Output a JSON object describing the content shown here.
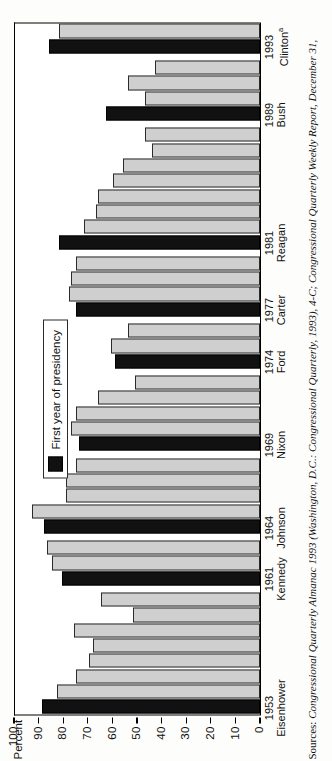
{
  "chart_data": {
    "type": "bar",
    "title": "",
    "xlabel": "",
    "ylabel": "Percent",
    "ylim": [
      0,
      100
    ],
    "grid": false,
    "legend_position": "inside-top-center",
    "legend": [
      {
        "label": "First year of presidency",
        "color": "#111111"
      }
    ],
    "series_colors": {
      "normal": "#cfcfcf",
      "first_year": "#111111"
    },
    "yticks": [
      "100",
      "90",
      "80",
      "70",
      "60",
      "50",
      "40",
      "30",
      "20",
      "10",
      "0"
    ],
    "ytick_values": [
      100,
      90,
      80,
      70,
      60,
      50,
      40,
      30,
      20,
      10,
      0
    ],
    "x_groups": [
      {
        "year": "1953",
        "name": "Eisenhower",
        "superscript": ""
      },
      {
        "year": "1961",
        "name": "Kennedy",
        "superscript": ""
      },
      {
        "year": "1964",
        "name": "Johnson",
        "superscript": ""
      },
      {
        "year": "1969",
        "name": "Nixon",
        "superscript": ""
      },
      {
        "year": "1974",
        "name": "Ford",
        "superscript": ""
      },
      {
        "year": "1977",
        "name": "Carter",
        "superscript": ""
      },
      {
        "year": "1981",
        "name": "Reagan",
        "superscript": ""
      },
      {
        "year": "1989",
        "name": "Bush",
        "superscript": ""
      },
      {
        "year": "1993",
        "name": "Clinton",
        "superscript": "a"
      }
    ],
    "bars": [
      {
        "year": "1953",
        "value": 89,
        "first_year": true
      },
      {
        "year": "1954",
        "value": 83,
        "first_year": false
      },
      {
        "year": "1955",
        "value": 75,
        "first_year": false
      },
      {
        "year": "1956",
        "value": 70,
        "first_year": false
      },
      {
        "year": "1957",
        "value": 68,
        "first_year": false
      },
      {
        "year": "1958",
        "value": 76,
        "first_year": false
      },
      {
        "year": "1959",
        "value": 52,
        "first_year": false
      },
      {
        "year": "1960",
        "value": 65,
        "first_year": false
      },
      {
        "year": "1961",
        "value": 81,
        "first_year": true
      },
      {
        "year": "1962",
        "value": 85,
        "first_year": false
      },
      {
        "year": "1963",
        "value": 87,
        "first_year": false
      },
      {
        "year": "1964",
        "value": 88,
        "first_year": true
      },
      {
        "year": "1965",
        "value": 93,
        "first_year": false
      },
      {
        "year": "1966",
        "value": 79,
        "first_year": false
      },
      {
        "year": "1967",
        "value": 79,
        "first_year": false
      },
      {
        "year": "1968",
        "value": 75,
        "first_year": false
      },
      {
        "year": "1969",
        "value": 74,
        "first_year": true
      },
      {
        "year": "1970",
        "value": 77,
        "first_year": false
      },
      {
        "year": "1971",
        "value": 75,
        "first_year": false
      },
      {
        "year": "1972",
        "value": 66,
        "first_year": false
      },
      {
        "year": "1973",
        "value": 51,
        "first_year": false
      },
      {
        "year": "1974",
        "value": 59,
        "first_year": true
      },
      {
        "year": "1975",
        "value": 61,
        "first_year": false
      },
      {
        "year": "1976",
        "value": 54,
        "first_year": false
      },
      {
        "year": "1977",
        "value": 75,
        "first_year": true
      },
      {
        "year": "1978",
        "value": 78,
        "first_year": false
      },
      {
        "year": "1979",
        "value": 77,
        "first_year": false
      },
      {
        "year": "1980",
        "value": 75,
        "first_year": false
      },
      {
        "year": "1981",
        "value": 82,
        "first_year": true
      },
      {
        "year": "1982",
        "value": 72,
        "first_year": false
      },
      {
        "year": "1983",
        "value": 67,
        "first_year": false
      },
      {
        "year": "1984",
        "value": 66,
        "first_year": false
      },
      {
        "year": "1985",
        "value": 60,
        "first_year": false
      },
      {
        "year": "1986",
        "value": 56,
        "first_year": false
      },
      {
        "year": "1987",
        "value": 44,
        "first_year": false
      },
      {
        "year": "1988",
        "value": 47,
        "first_year": false
      },
      {
        "year": "1989",
        "value": 63,
        "first_year": true
      },
      {
        "year": "1990",
        "value": 47,
        "first_year": false
      },
      {
        "year": "1991",
        "value": 54,
        "first_year": false
      },
      {
        "year": "1992",
        "value": 43,
        "first_year": false
      },
      {
        "year": "1993",
        "value": 86,
        "first_year": true
      },
      {
        "year": "1993b",
        "value": 82,
        "first_year": false
      }
    ]
  },
  "source": {
    "lead": "Sources:",
    "text": " Congressional Quarterly Almanac 1993 (Washington, D.C.: Congressional Quarterly, 1993), 4-C; Congressional Quarterly Weekly Report, December 31,"
  }
}
